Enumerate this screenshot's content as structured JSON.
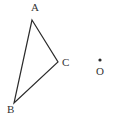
{
  "figure": {
    "type": "geometry-diagram",
    "background_color": "#ffffff",
    "stroke_color": "#2b2b2b",
    "label_color": "#333333",
    "stroke_width": 1.2,
    "width": 114,
    "height": 127,
    "triangle": {
      "name": "triangle-ABC",
      "vertices": [
        {
          "label": "A",
          "x": 32,
          "y": 20,
          "label_x": 31,
          "label_y": 2
        },
        {
          "label": "B",
          "x": 14,
          "y": 103,
          "label_x": 7,
          "label_y": 104
        },
        {
          "label": "C",
          "x": 58,
          "y": 62,
          "label_x": 62,
          "label_y": 57
        }
      ],
      "edges": [
        {
          "name": "edge-AB",
          "from": "A",
          "to": "B"
        },
        {
          "name": "edge-BC",
          "from": "B",
          "to": "C"
        },
        {
          "name": "edge-CA",
          "from": "C",
          "to": "A"
        }
      ]
    },
    "points": [
      {
        "label": "O",
        "x": 100,
        "y": 60,
        "radius": 1.6,
        "label_x": 96,
        "label_y": 66
      }
    ]
  }
}
